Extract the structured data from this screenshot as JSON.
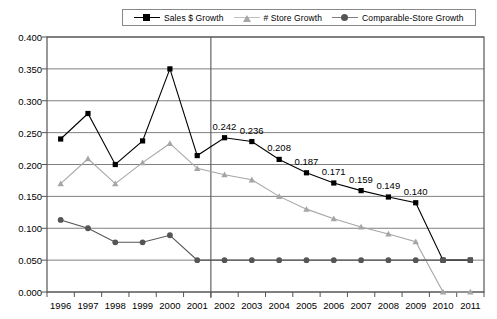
{
  "chart_data": {
    "type": "line",
    "title": "",
    "xlabel": "",
    "ylabel": "",
    "grid": true,
    "legend_position": "top",
    "categories": [
      "1996",
      "1997",
      "1998",
      "1999",
      "2000",
      "2001",
      "2002",
      "2003",
      "2004",
      "2005",
      "2006",
      "2007",
      "2008",
      "2009",
      "2010",
      "2011"
    ],
    "ylim": [
      0.0,
      0.4
    ],
    "yticks": [
      "0.000",
      "0.050",
      "0.100",
      "0.150",
      "0.200",
      "0.250",
      "0.300",
      "0.350",
      "0.400"
    ],
    "ytick_values": [
      0.0,
      0.05,
      0.1,
      0.15,
      0.2,
      0.25,
      0.3,
      0.35,
      0.4
    ],
    "series": [
      {
        "name": "Sales $ Growth",
        "color": "#000000",
        "marker": "square",
        "values": [
          0.24,
          0.28,
          0.2,
          0.237,
          0.35,
          0.214,
          0.242,
          0.236,
          0.208,
          0.187,
          0.171,
          0.159,
          0.149,
          0.14,
          0.05,
          0.05
        ],
        "point_labels": [
          "",
          "",
          "",
          "",
          "",
          "",
          "0.242",
          "0.236",
          "0.208",
          "0.187",
          "0.171",
          "0.159",
          "0.149",
          "0.140",
          "",
          ""
        ]
      },
      {
        "name": "# Store Growth",
        "color": "#a6a6a6",
        "marker": "triangle",
        "values": [
          0.17,
          0.209,
          0.17,
          0.203,
          0.233,
          0.194,
          0.184,
          0.176,
          0.15,
          0.13,
          0.115,
          0.102,
          0.091,
          0.079,
          0.0,
          0.0
        ],
        "point_labels": [
          "",
          "",
          "",
          "",
          "",
          "",
          "",
          "",
          "",
          "",
          "",
          "",
          "",
          "",
          "",
          ""
        ]
      },
      {
        "name": "Comparable-Store Growth",
        "color": "#555555",
        "marker": "circle",
        "values": [
          0.113,
          0.1,
          0.078,
          0.078,
          0.089,
          0.05,
          0.05,
          0.05,
          0.05,
          0.05,
          0.05,
          0.05,
          0.05,
          0.05,
          0.05,
          0.05
        ],
        "point_labels": [
          "",
          "",
          "",
          "",
          "",
          "",
          "",
          "",
          "",
          "",
          "",
          "",
          "",
          "",
          "",
          ""
        ]
      }
    ],
    "annotations": [
      {
        "name": "period-divider",
        "type": "vline",
        "at_category": "2001.5"
      }
    ]
  },
  "colors": {
    "axis": "#555555",
    "grid": "#808080",
    "plot_border": "#555555",
    "background": "#ffffff"
  }
}
